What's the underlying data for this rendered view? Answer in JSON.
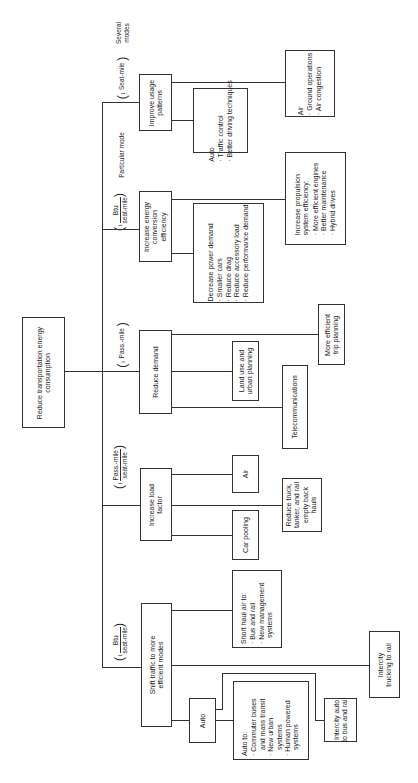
{
  "diagram": {
    "root": {
      "label": "Reduce transportation energy consumption"
    },
    "categories": {
      "particular_mode": "Particular mode",
      "several_modes": "Several\nmodes"
    },
    "branches": [
      {
        "id": "improve-usage",
        "label": "Improve usage patterns",
        "metric": {
          "arrow": "down",
          "text": "Seat-mile"
        },
        "children": [
          {
            "title": "Auto",
            "items": [
              "Traffic control",
              "Better driving techniques"
            ]
          },
          {
            "title": "Air",
            "items": [
              "Ground operations",
              "Air congestion"
            ]
          }
        ]
      },
      {
        "id": "energy-conversion",
        "label": "Increase energy conversion efficiency",
        "metric": {
          "arrow": "down",
          "numerator": "Btu",
          "denominator": "seat-mile"
        },
        "children": [
          {
            "title": "Decrease power demand",
            "items": [
              "Smaller cars",
              "Reduce drag",
              "Reduce accessory load",
              "Reduce performance demand"
            ]
          },
          {
            "title": "Increase propulsion system efficiency:",
            "items": [
              "More efficient engines",
              "Better maintenance",
              "Hybrid drives"
            ]
          }
        ]
      },
      {
        "id": "reduce-demand",
        "label": "Reduce demand",
        "metric": {
          "arrow": "down",
          "text": "Pass.-mile"
        },
        "children": [
          {
            "title": "Land use and urban planning"
          },
          {
            "title": "Telecommunications"
          },
          {
            "title": "More efficient trip planning"
          }
        ]
      },
      {
        "id": "load-factor",
        "label": "Increase load factor",
        "metric": {
          "arrow": "up",
          "numerator": "Pass.-mile",
          "denominator": "seat-mile"
        },
        "children": [
          {
            "title": "Air"
          },
          {
            "title": "Car pooling"
          },
          {
            "title": "Reduce truck, tanker, and rail empty back hauls"
          }
        ]
      },
      {
        "id": "shift-traffic",
        "label": "Shift traffic to more efficient modes",
        "metric": {
          "arrow": "down",
          "numerator": "Btu",
          "denominator": "seat-mile"
        },
        "children": [
          {
            "title": "Short haul air to:",
            "items": [
              "Bus and rail",
              "New management systems"
            ]
          },
          {
            "title": "Auto"
          },
          {
            "title": "Auto to:",
            "items": [
              "Commuter buses and mass transit",
              "New urban systems",
              "Human powered systems"
            ]
          },
          {
            "title": "Intercity auto to bus and rail"
          },
          {
            "title": "Intercity trucking to rail"
          }
        ]
      }
    ]
  }
}
